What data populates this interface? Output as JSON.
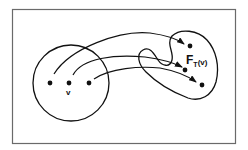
{
  "diagram": {
    "type": "set-mapping",
    "source_set": {
      "points": 3,
      "label": "v"
    },
    "target_set": {
      "points": 3,
      "label_main": "F",
      "label_sub": "T",
      "label_arg": "(v)"
    },
    "arrows": 3,
    "colors": {
      "frame": "#6a6a6a",
      "ink": "#111111",
      "background": "#ffffff"
    }
  }
}
